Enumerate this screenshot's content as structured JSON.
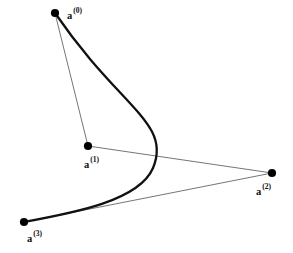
{
  "figure": {
    "type": "bezier-curve-diagram",
    "width": 293,
    "height": 253,
    "background_color": "#ffffff",
    "curve_color": "#111111",
    "curve_width": 2.3,
    "polygon_color": "#3a3a3a",
    "polygon_width": 0.7,
    "point_color": "#000000",
    "point_radius": 4.1
  },
  "chart_data": {
    "type": "line",
    "title": "",
    "xlabel": "",
    "ylabel": "",
    "grid": false,
    "legend": "none",
    "xlim": [
      0,
      293
    ],
    "ylim": [
      253,
      0
    ],
    "control_points": [
      {
        "name": "a0",
        "label_base": "a",
        "label_sup": "(0)",
        "x": 55,
        "y": 13,
        "label_x": 67,
        "label_y": 8
      },
      {
        "name": "a1",
        "label_base": "a",
        "label_sup": "(1)",
        "x": 88,
        "y": 146,
        "label_x": 84,
        "label_y": 157
      },
      {
        "name": "a2",
        "label_base": "a",
        "label_sup": "(2)",
        "x": 272,
        "y": 173,
        "label_x": 256,
        "label_y": 184
      },
      {
        "name": "a3",
        "label_base": "a",
        "label_sup": "(3)",
        "x": 24,
        "y": 222,
        "label_x": 27,
        "label_y": 231
      }
    ],
    "control_polygon_path": "M 55 13 L 88 146 L 272 173 L 24 222",
    "bezier_path": "M 55 13 C 120 108 172 123 153 168 C 139 201 73 213 24 222",
    "series": [
      {
        "name": "bezier-curve",
        "x": [
          55,
          76,
          95,
          112,
          127,
          139,
          148,
          153,
          154,
          150,
          141,
          127,
          109,
          88,
          64,
          42,
          24
        ],
        "y": [
          13,
          39,
          63,
          85,
          105,
          124,
          142,
          157,
          168,
          180,
          191,
          200,
          208,
          214,
          218,
          221,
          222
        ]
      },
      {
        "name": "control-polygon",
        "x": [
          55,
          88,
          272,
          24
        ],
        "y": [
          13,
          146,
          173,
          222
        ]
      }
    ]
  },
  "labels": {
    "a0": {
      "base": "a",
      "sup": "(0)"
    },
    "a1": {
      "base": "a",
      "sup": "(1)"
    },
    "a2": {
      "base": "a",
      "sup": "(2)"
    },
    "a3": {
      "base": "a",
      "sup": "(3)"
    }
  }
}
